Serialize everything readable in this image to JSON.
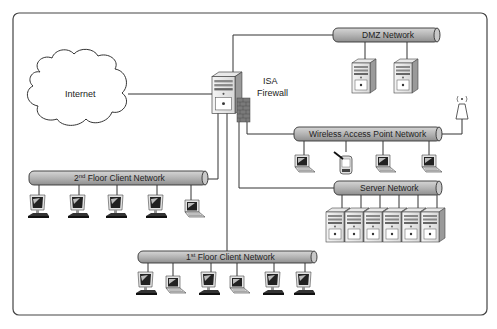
{
  "diagram": {
    "internet": {
      "label": "Internet"
    },
    "firewall": {
      "label_line1": "ISA",
      "label_line2": "Firewall"
    },
    "networks": {
      "dmz": {
        "label": "DMZ Network",
        "devices": [
          "server",
          "server"
        ]
      },
      "wireless": {
        "label": "Wireless Access Point Network",
        "devices": [
          "laptop",
          "pda",
          "laptop",
          "laptop"
        ],
        "access_point": "wireless-antenna"
      },
      "server": {
        "label": "Server Network",
        "devices": [
          "server",
          "server",
          "server",
          "server",
          "server",
          "server"
        ]
      },
      "floor2": {
        "label_prefix": "2",
        "label_sup": "nd",
        "label_rest": " Floor Client Network",
        "devices": [
          "desktop",
          "desktop",
          "desktop",
          "desktop",
          "laptop"
        ]
      },
      "floor1": {
        "label_prefix": "1",
        "label_sup": "st",
        "label_rest": " Floor Client Network",
        "devices": [
          "desktop",
          "laptop",
          "desktop",
          "laptop",
          "desktop",
          "desktop"
        ]
      }
    },
    "colors": {
      "pipe_fill": "#b8b8b8",
      "stroke": "#333333",
      "background": "#ffffff"
    }
  }
}
